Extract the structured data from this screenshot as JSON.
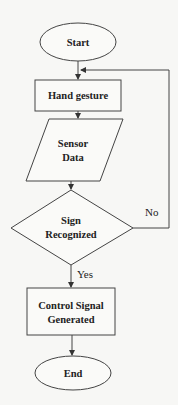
{
  "diagram": {
    "type": "flowchart",
    "nodes": {
      "start": {
        "label": "Start",
        "shape": "ellipse"
      },
      "hand_gesture": {
        "label": "Hand gesture",
        "shape": "rectangle"
      },
      "sensor_data": {
        "line1": "Sensor",
        "line2": "Data",
        "shape": "parallelogram"
      },
      "sign_recognized": {
        "line1": "Sign",
        "line2": "Recognized",
        "shape": "diamond"
      },
      "control_signal": {
        "line1": "Control Signal",
        "line2": "Generated",
        "shape": "rectangle"
      },
      "end": {
        "label": "End",
        "shape": "ellipse"
      }
    },
    "edges": {
      "yes_label": "Yes",
      "no_label": "No"
    }
  }
}
